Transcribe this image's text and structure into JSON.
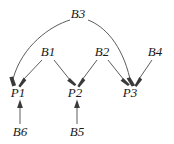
{
  "diagram": {
    "type": "directed-acyclic-graph",
    "background_color": "#ffffff",
    "edge_color": "#4a4a4a",
    "label_color": "#1a1a1a",
    "nodes": [
      {
        "id": "B3",
        "label": "B3",
        "x": 78,
        "y": 14,
        "row": "top"
      },
      {
        "id": "B1",
        "label": "B1",
        "x": 48,
        "y": 52,
        "row": "middle"
      },
      {
        "id": "B2",
        "label": "B2",
        "x": 102,
        "y": 52,
        "row": "middle"
      },
      {
        "id": "B4",
        "label": "B4",
        "x": 155,
        "y": 52,
        "row": "middle"
      },
      {
        "id": "P1",
        "label": "P1",
        "x": 18,
        "y": 93,
        "row": "parent"
      },
      {
        "id": "P2",
        "label": "P2",
        "x": 75,
        "y": 93,
        "row": "parent"
      },
      {
        "id": "P3",
        "label": "P3",
        "x": 130,
        "y": 93,
        "row": "parent"
      },
      {
        "id": "B6",
        "label": "B6",
        "x": 20,
        "y": 132,
        "row": "bottom"
      },
      {
        "id": "B5",
        "label": "B5",
        "x": 77,
        "y": 132,
        "row": "bottom"
      }
    ],
    "edges": [
      {
        "from": "B3",
        "to": "P1",
        "style": "curved"
      },
      {
        "from": "B3",
        "to": "P3",
        "style": "curved"
      },
      {
        "from": "B1",
        "to": "P1",
        "style": "straight"
      },
      {
        "from": "B1",
        "to": "P2",
        "style": "straight"
      },
      {
        "from": "B2",
        "to": "P2",
        "style": "straight"
      },
      {
        "from": "B2",
        "to": "P3",
        "style": "straight"
      },
      {
        "from": "B4",
        "to": "P3",
        "style": "straight"
      },
      {
        "from": "B6",
        "to": "P1",
        "style": "straight"
      },
      {
        "from": "B5",
        "to": "P2",
        "style": "straight"
      }
    ]
  }
}
